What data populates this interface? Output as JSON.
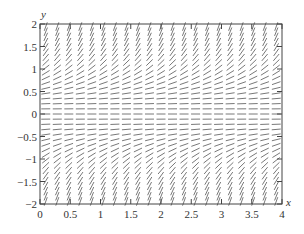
{
  "chart_data": {
    "type": "slope_field",
    "title": "",
    "equation": "dy/dx = y^2",
    "xlabel": "x",
    "ylabel": "y",
    "xlim": [
      0,
      4
    ],
    "ylim": [
      -2,
      2
    ],
    "x_ticks": [
      0,
      0.5,
      1,
      1.5,
      2,
      2.5,
      3,
      3.5,
      4
    ],
    "x_tick_labels": [
      "0",
      "0.5",
      "1",
      "1.5",
      "2",
      "2.5",
      "3",
      "3.5",
      "4"
    ],
    "y_ticks": [
      -2,
      -1.5,
      -1,
      -0.5,
      0,
      0.5,
      1,
      1.5,
      2
    ],
    "y_tick_labels": [
      "−2",
      "−1.5",
      "−1",
      "−0.5",
      "0",
      "0.5",
      "1",
      "1.5",
      "2"
    ],
    "grid": false,
    "legend": null,
    "field_grid": {
      "columns": 21,
      "rows": 35
    },
    "segment_color": "#555555",
    "frame_color": "#444444"
  },
  "layout": {
    "plot_left": 40,
    "plot_right": 282,
    "plot_top": 24,
    "plot_bottom": 204,
    "segment_length": 9
  }
}
